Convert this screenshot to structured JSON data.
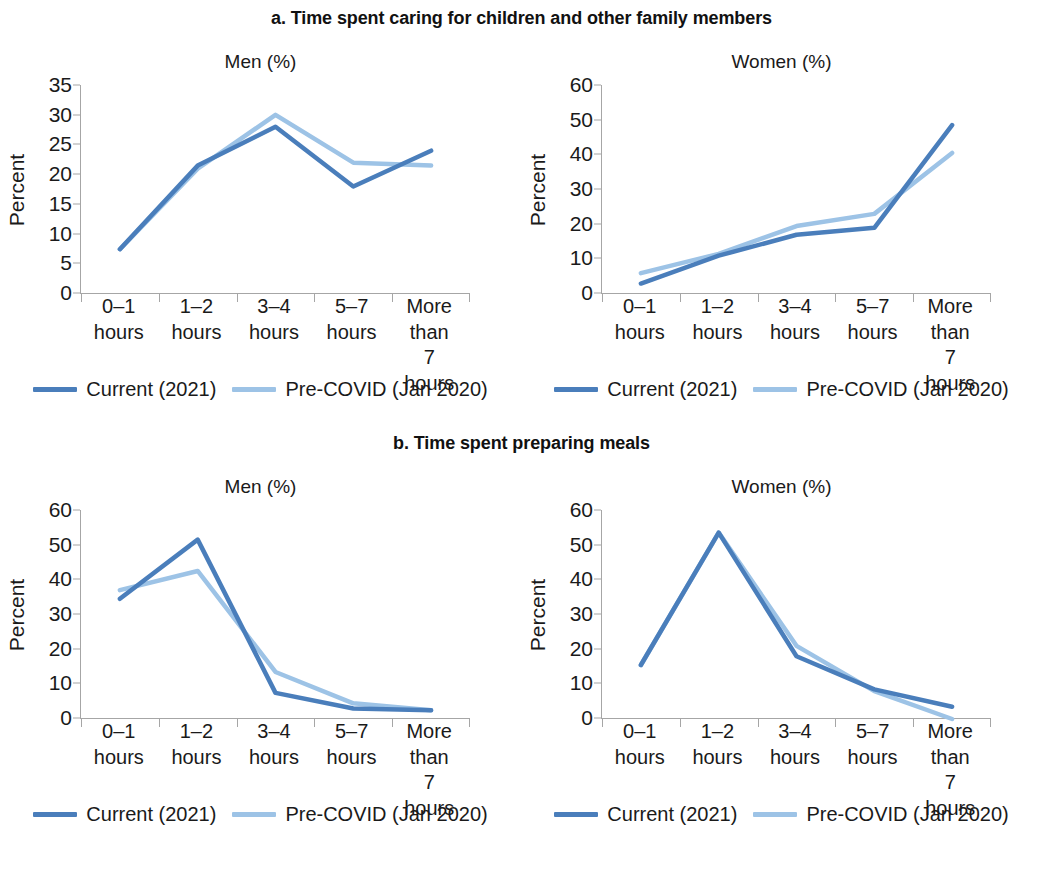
{
  "colors": {
    "current": "#4A7EBB",
    "precovid": "#9DC3E6",
    "axis": "#A6A6A6",
    "text": "#1A1A1A"
  },
  "panels": [
    {
      "title": "a. Time spent caring for children and other family members",
      "charts": [
        {
          "subtitle": "Men (%)",
          "ylabel": "Percent"
        },
        {
          "subtitle": "Women (%)",
          "ylabel": "Percent"
        }
      ]
    },
    {
      "title": "b. Time spent preparing meals",
      "charts": [
        {
          "subtitle": "Men (%)",
          "ylabel": "Percent"
        },
        {
          "subtitle": "Women (%)",
          "ylabel": "Percent"
        }
      ]
    }
  ],
  "legend": {
    "items": [
      {
        "label": "Current (2021)",
        "color": "#4A7EBB"
      },
      {
        "label": "Pre-COVID (Jan 2020)",
        "color": "#9DC3E6"
      }
    ]
  },
  "chart_data": [
    {
      "id": "a-men",
      "type": "line",
      "title": "a. Time spent caring for children and other family members",
      "subtitle": "Men (%)",
      "xlabel": "",
      "ylabel": "Percent",
      "ylim": [
        0,
        35
      ],
      "yticks": [
        0,
        5,
        10,
        15,
        20,
        25,
        30,
        35
      ],
      "grid": false,
      "legend_position": "bottom",
      "categories": [
        "0–1\nhours",
        "1–2\nhours",
        "3–4\nhours",
        "5–7\nhours",
        "More\nthan\n7 hours"
      ],
      "series": [
        {
          "name": "Current (2021)",
          "color": "#4A7EBB",
          "values": [
            7.5,
            21.5,
            28,
            18,
            24
          ]
        },
        {
          "name": "Pre-COVID (Jan 2020)",
          "color": "#9DC3E6",
          "values": [
            7.5,
            21,
            30,
            22,
            21.5
          ]
        }
      ]
    },
    {
      "id": "a-women",
      "type": "line",
      "title": "a. Time spent caring for children and other family members",
      "subtitle": "Women (%)",
      "xlabel": "",
      "ylabel": "Percent",
      "ylim": [
        0,
        60
      ],
      "yticks": [
        0,
        10,
        20,
        30,
        40,
        50,
        60
      ],
      "grid": false,
      "legend_position": "bottom",
      "categories": [
        "0–1\nhours",
        "1–2\nhours",
        "3–4\nhours",
        "5–7\nhours",
        "More\nthan\n7 hours"
      ],
      "series": [
        {
          "name": "Current (2021)",
          "color": "#4A7EBB",
          "values": [
            3,
            11,
            17,
            19,
            48.5
          ]
        },
        {
          "name": "Pre-COVID (Jan 2020)",
          "color": "#9DC3E6",
          "values": [
            6,
            11.5,
            19.5,
            23,
            40.5
          ]
        }
      ]
    },
    {
      "id": "b-men",
      "type": "line",
      "title": "b. Time spent preparing meals",
      "subtitle": "Men (%)",
      "xlabel": "",
      "ylabel": "Percent",
      "ylim": [
        0,
        60
      ],
      "yticks": [
        0,
        10,
        20,
        30,
        40,
        50,
        60
      ],
      "grid": false,
      "legend_position": "bottom",
      "categories": [
        "0–1\nhours",
        "1–2\nhours",
        "3–4\nhours",
        "5–7\nhours",
        "More\nthan\n7 hours"
      ],
      "series": [
        {
          "name": "Current (2021)",
          "color": "#4A7EBB",
          "values": [
            34.5,
            51.5,
            7.5,
            3,
            2.5
          ]
        },
        {
          "name": "Pre-COVID (Jan 2020)",
          "color": "#9DC3E6",
          "values": [
            37,
            42.5,
            13.5,
            4.5,
            2.5
          ]
        }
      ]
    },
    {
      "id": "b-women",
      "type": "line",
      "title": "b. Time spent preparing meals",
      "subtitle": "Women (%)",
      "xlabel": "",
      "ylabel": "Percent",
      "ylim": [
        0,
        60
      ],
      "yticks": [
        0,
        10,
        20,
        30,
        40,
        50,
        60
      ],
      "grid": false,
      "legend_position": "bottom",
      "categories": [
        "0–1\nhours",
        "1–2\nhours",
        "3–4\nhours",
        "5–7\nhours",
        "More\nthan\n7 hours"
      ],
      "series": [
        {
          "name": "Current (2021)",
          "color": "#4A7EBB",
          "values": [
            15.5,
            53.5,
            18,
            8.5,
            3.5
          ]
        },
        {
          "name": "Pre-COVID (Jan 2020)",
          "color": "#9DC3E6",
          "values": [
            15.5,
            53.5,
            21,
            8,
            0
          ]
        }
      ]
    }
  ]
}
